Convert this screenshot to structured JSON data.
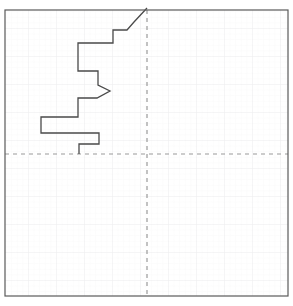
{
  "figure": {
    "width": 293,
    "height": 306,
    "background_color": "#ffffff",
    "title": "",
    "caption": ""
  },
  "frame": {
    "x": 5,
    "y": 10,
    "width": 283,
    "height": 286,
    "border_color": "#5a5a5a",
    "border_width": 1.2,
    "fill_color": "#ffffff"
  },
  "grid": {
    "visible": true,
    "minor_spacing": 5.6,
    "major_spacing": 28,
    "minor_color": "#f2f2f4",
    "major_color": "#e6e6ea",
    "minor_width": 0.5,
    "major_width": 0.7
  },
  "axes": {
    "vertical_ref": {
      "label": "vertical-reference-line",
      "x": 147,
      "color": "#9a9a9a",
      "dash": "4 4",
      "width": 1.2
    },
    "horizontal_ref": {
      "label": "horizontal-reference-line",
      "y": 154,
      "color": "#9a9a9a",
      "dash": "4 4",
      "width": 1.2
    },
    "origin_x": 147,
    "origin_y": 154
  },
  "chart_data": {
    "type": "line",
    "subtype": "step-profile",
    "title": "",
    "subtitle": "",
    "xlabel": "",
    "ylabel": "",
    "xlim": [
      5,
      288
    ],
    "ylim": [
      296,
      10
    ],
    "grid": true,
    "legend": "none",
    "annotations": [],
    "series": [
      {
        "name": "step-profile",
        "color": "#4a4a4a",
        "line_width": 1.3,
        "fill": "none",
        "points": [
          [
            147,
            8
          ],
          [
            134,
            22
          ],
          [
            127,
            30
          ],
          [
            113,
            30
          ],
          [
            113,
            43
          ],
          [
            78,
            43
          ],
          [
            78,
            53
          ],
          [
            78,
            71
          ],
          [
            98,
            71
          ],
          [
            98,
            80
          ],
          [
            98,
            85
          ],
          [
            110,
            91
          ],
          [
            97,
            98
          ],
          [
            78,
            98
          ],
          [
            78,
            106
          ],
          [
            78,
            117
          ],
          [
            41,
            117
          ],
          [
            41,
            133
          ],
          [
            99,
            133
          ],
          [
            99,
            144
          ],
          [
            79,
            144
          ],
          [
            79,
            154
          ]
        ]
      }
    ],
    "vertices": [
      {
        "name": "top-start",
        "x": 147,
        "y": 8
      },
      {
        "name": "diagonal-knee",
        "x": 127,
        "y": 30
      },
      {
        "name": "step-1-left",
        "x": 113,
        "y": 30
      },
      {
        "name": "step-1-bottom",
        "x": 113,
        "y": 43
      },
      {
        "name": "step-2-left",
        "x": 78,
        "y": 43
      },
      {
        "name": "step-2-bottom",
        "x": 78,
        "y": 71
      },
      {
        "name": "step-3-right",
        "x": 98,
        "y": 71
      },
      {
        "name": "peak-apex",
        "x": 110,
        "y": 91
      },
      {
        "name": "peak-return",
        "x": 78,
        "y": 98
      },
      {
        "name": "step-4-bottom",
        "x": 78,
        "y": 117
      },
      {
        "name": "leftmost-extent",
        "x": 41,
        "y": 117
      },
      {
        "name": "leftmost-bottom",
        "x": 41,
        "y": 133
      },
      {
        "name": "step-5-right",
        "x": 99,
        "y": 133
      },
      {
        "name": "step-5-bottom",
        "x": 99,
        "y": 144
      },
      {
        "name": "end-point",
        "x": 79,
        "y": 154
      }
    ]
  }
}
